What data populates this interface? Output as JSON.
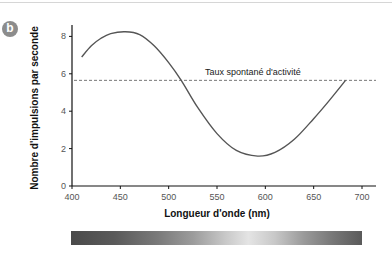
{
  "panel": {
    "label": "b"
  },
  "chart_data": {
    "type": "line",
    "title": "",
    "xlabel": "Longueur d'onde (nm)",
    "ylabel": "Nombre d'impulsions par seconde",
    "xlim": [
      400,
      710
    ],
    "ylim": [
      0,
      8.6
    ],
    "xticks": [
      400,
      450,
      500,
      550,
      600,
      650,
      700
    ],
    "yticks": [
      0,
      2,
      4,
      6,
      8
    ],
    "grid": false,
    "legend": null,
    "series": [
      {
        "name": "Réponse du neurone",
        "x": [
          410,
          420,
          430,
          440,
          455,
          470,
          485,
          500,
          513,
          530,
          550,
          570,
          592,
          610,
          630,
          650,
          665,
          683
        ],
        "values": [
          6.9,
          7.5,
          7.9,
          8.15,
          8.25,
          8.1,
          7.5,
          6.6,
          5.65,
          4.2,
          2.8,
          1.9,
          1.6,
          1.8,
          2.5,
          3.6,
          4.5,
          5.65
        ]
      }
    ],
    "reference_line": {
      "y": 5.65,
      "style": "dashed",
      "label": "Taux spontané d'activité"
    },
    "annotations": [
      "Taux spontané d'activité"
    ],
    "spectrum_bar": {
      "from_nm": 400,
      "to_nm": 700,
      "description": "grayscale wavelength spectrum, lightest near 590 nm"
    }
  }
}
